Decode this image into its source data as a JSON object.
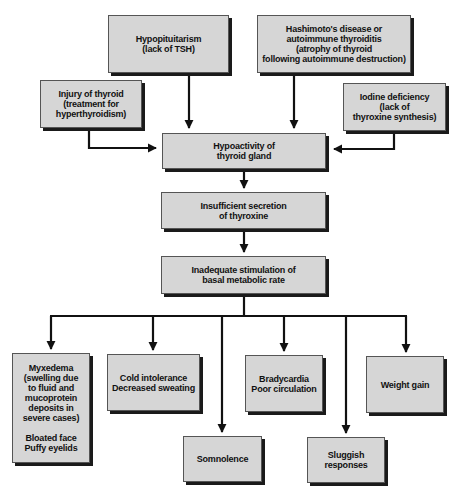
{
  "diagram": {
    "colors": {
      "box_fill": "#d6d6d6",
      "box_shadow": "#1a1a1a",
      "line": "#111111",
      "text": "#111111",
      "background": "#ffffff"
    },
    "causes": {
      "hypopituitarism": "Hypopituitarism\n(lack of TSH)",
      "hashimoto": "Hashimoto's disease or\nautoimmune thyroiditis\n(atrophy of thyroid\nfollowing autoimmune destruction)",
      "injury": "Injury of thyroid\n(treatment for\nhyperthyroidism)",
      "iodine": "Iodine deficiency\n(lack of\nthyroxine synthesis)"
    },
    "chain": {
      "hypoactivity": "Hypoactivity of\nthyroid gland",
      "insufficient": "Insufficient secretion\nof thyroxine",
      "inadequate": "Inadequate stimulation of\nbasal metabolic rate"
    },
    "effects": {
      "myxedema": "Myxedema\n(swelling due\nto fluid and\nmucoprotein\ndeposits in\nsevere cases)\n\nBloated face\nPuffy eyelids",
      "cold": "Cold intolerance\nDecreased sweating",
      "somnolence": "Somnolence",
      "bradycardia": "Bradycardia\nPoor circulation",
      "sluggish": "Sluggish\nresponses",
      "weight": "Weight gain"
    }
  }
}
